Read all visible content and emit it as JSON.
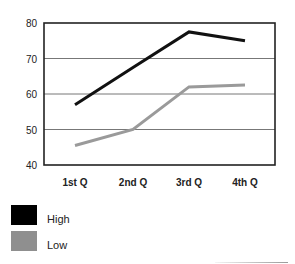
{
  "chart_data": {
    "type": "line",
    "title": "",
    "xlabel": "",
    "ylabel": "",
    "categories": [
      "1st Q",
      "2nd Q",
      "3rd Q",
      "4th Q"
    ],
    "series": [
      {
        "name": "High",
        "color": "#111111",
        "values": [
          57,
          67.5,
          77.5,
          75
        ]
      },
      {
        "name": "Low",
        "color": "#9a9a9a",
        "values": [
          45.5,
          50,
          62,
          62.5
        ]
      }
    ],
    "ylim": [
      40,
      80
    ],
    "yticks": [
      40,
      50,
      60,
      70,
      80
    ],
    "grid": true,
    "legend_position": "bottom-left"
  },
  "legend": {
    "items": [
      {
        "label": "High",
        "color": "#000000"
      },
      {
        "label": "Low",
        "color": "#8f8f8f"
      }
    ]
  }
}
